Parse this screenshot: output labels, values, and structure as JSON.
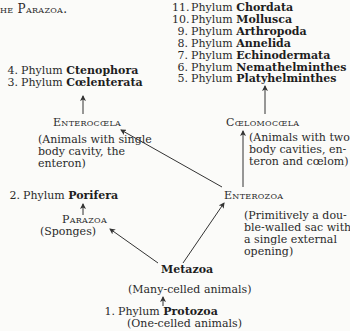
{
  "header": {
    "fragment": "he Parazoa."
  },
  "left_branch": {
    "phyla": [
      {
        "num": "4.",
        "prefix": "Phylum",
        "name": "Ctenophora"
      },
      {
        "num": "3.",
        "prefix": "Phylum",
        "name": "Cœlenterata"
      }
    ],
    "group": "Enterocœla",
    "description": [
      "(Animals with single",
      "body   cavity,    the",
      "enteron)"
    ],
    "porifera": {
      "num": "2.",
      "prefix": "Phylum",
      "name": "Porifera"
    },
    "parazoa": "Parazoa",
    "parazoa_note": "(Sponges)"
  },
  "right_branch": {
    "phyla": [
      {
        "num": "11.",
        "prefix": "Phylum",
        "name": "Chordata"
      },
      {
        "num": "10.",
        "prefix": "Phylum",
        "name": "Mollusca"
      },
      {
        "num": "9.",
        "prefix": "Phylum",
        "name": "Arthropoda"
      },
      {
        "num": "8.",
        "prefix": "Phylum",
        "name": "Annelida"
      },
      {
        "num": "7.",
        "prefix": "Phylum",
        "name": "Echinodermata"
      },
      {
        "num": "6.",
        "prefix": "Phylum",
        "name": "Nemathelminthes"
      },
      {
        "num": "5.",
        "prefix": "Phylum",
        "name": "Platyhelminthes"
      }
    ],
    "group": "Cœlomocœla",
    "description": [
      "(Animals with two",
      "body  cavities,  en-",
      "teron and cœlom)"
    ],
    "enterozoa": "Enterozoa",
    "enterozoa_description": [
      "(Primitively a dou-",
      "ble-walled sac with",
      "a    single    external",
      "opening)"
    ]
  },
  "root": {
    "metazoa": "Metazoa",
    "metazoa_note": "(Many-celled animals)",
    "protozoa": {
      "num": "1.",
      "prefix": "Phylum",
      "name": "Protozoa"
    },
    "protozoa_note": "(One-celled animals)"
  },
  "colors": {
    "text": "#2a2a2a",
    "line": "#333333",
    "background": "#fbfbf9"
  }
}
